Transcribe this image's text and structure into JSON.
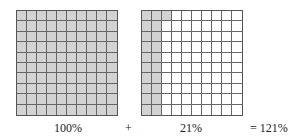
{
  "figure": {
    "grids": [
      {
        "name": "full-hundred-grid",
        "rows": 10,
        "cols": 10,
        "shaded_cells": 100,
        "label": "100%"
      },
      {
        "name": "partial-hundred-grid",
        "rows": 10,
        "cols": 10,
        "shaded_cells": 21,
        "shaded_pattern": "2 full columns + 1 cell in row 1 col 3",
        "label": "21%"
      }
    ],
    "operator_plus": "+",
    "result": "= 121%",
    "colors": {
      "shaded": "#d2d2d2",
      "unshaded": "#ffffff",
      "grid_line": "#666666"
    }
  }
}
